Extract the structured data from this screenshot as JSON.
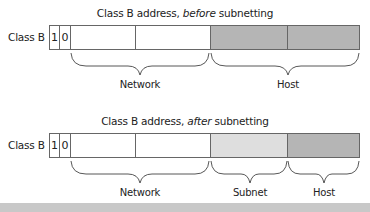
{
  "diagram": {
    "before": {
      "title_prefix": "Class B address, ",
      "title_emph": "before",
      "title_suffix": " subnetting",
      "row_label": "Class B",
      "bits": [
        "1",
        "0"
      ],
      "segments": [
        {
          "label": "Network",
          "fill": "#ffffff"
        },
        {
          "label": "Host",
          "fill": "#b5b5b5"
        }
      ]
    },
    "after": {
      "title_prefix": "Class B address, ",
      "title_emph": "after",
      "title_suffix": " subnetting",
      "row_label": "Class B",
      "bits": [
        "1",
        "0"
      ],
      "segments": [
        {
          "label": "Network",
          "fill": "#ffffff"
        },
        {
          "label": "Subnet",
          "fill": "#dedede"
        },
        {
          "label": "Host",
          "fill": "#b5b5b5"
        }
      ]
    }
  }
}
